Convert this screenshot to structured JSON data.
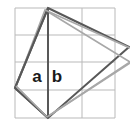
{
  "figure": {
    "canvas": {
      "width": 130,
      "height": 129,
      "background": "#ffffff"
    },
    "colors": {
      "grid_line": "#b9b9b9",
      "primary_shape": "#585858",
      "secondary_shape": "#a8a8a8",
      "label": "#1a1a1a"
    },
    "grid": {
      "visible": true,
      "x_lines": [
        15,
        48,
        82,
        115
      ],
      "y_lines": [
        8,
        35,
        62,
        90,
        118
      ],
      "columns": 3,
      "rows": 4,
      "stroke_width": 1
    },
    "labels": [
      {
        "name": "label-a",
        "text": "a",
        "x": 37,
        "y": 82
      },
      {
        "name": "label-b",
        "text": "b",
        "x": 57,
        "y": 82
      }
    ],
    "shapes": [
      {
        "name": "primary-quadrilateral",
        "kind": "polygon",
        "color": "#585858",
        "stroke_width": 2,
        "points": "48,8 129,47 48,118 15,88"
      },
      {
        "name": "secondary-quadrilateral",
        "kind": "polygon",
        "color": "#a8a8a8",
        "stroke_width": 1.6,
        "points": "45,10 130,62 47,117 16,86"
      },
      {
        "name": "segment-a",
        "kind": "line",
        "color": "#585858",
        "stroke_width": 2,
        "points": "48,8 15,88"
      },
      {
        "name": "segment-b",
        "kind": "line",
        "color": "#585858",
        "stroke_width": 2,
        "points": "48,8 48,118"
      },
      {
        "name": "chord-left-to-bottom",
        "kind": "line",
        "color": "#585858",
        "stroke_width": 2,
        "points": "15,88 48,118"
      },
      {
        "name": "light-chord-left-bottom",
        "kind": "line",
        "color": "#a8a8a8",
        "stroke_width": 1.6,
        "points": "16,86 47,117"
      },
      {
        "name": "light-diagonal-upper",
        "kind": "line",
        "color": "#a8a8a8",
        "stroke_width": 1.6,
        "points": "45,10 130,48"
      },
      {
        "name": "light-diagonal-lower",
        "kind": "line",
        "color": "#a8a8a8",
        "stroke_width": 1.6,
        "points": "47,117 130,63"
      }
    ]
  }
}
